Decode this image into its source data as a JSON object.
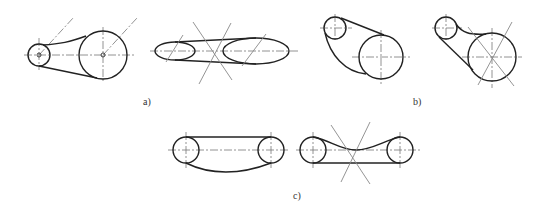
{
  "figure": {
    "type": "belt drive tension arrangement schematics",
    "panels": [
      {
        "id": "a",
        "label": "a)",
        "description": "Horizontal belt drives: round pulleys and ellipse-view pulleys with construction lines"
      },
      {
        "id": "b",
        "label": "b)",
        "description": "Inclined belt drives with small upper pulley and large lower pulley"
      },
      {
        "id": "c",
        "label": "c)",
        "description": "Equal-size pulleys with sagging/straight belt spans"
      }
    ]
  },
  "colors": {
    "outline": "#222222",
    "centerline": "#777777",
    "construction": "#888888",
    "background": "#ffffff"
  }
}
